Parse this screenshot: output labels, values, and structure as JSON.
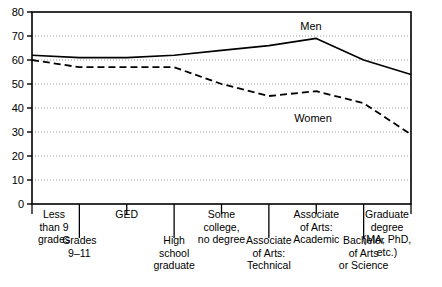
{
  "chart_data": {
    "type": "line",
    "title": "",
    "subtitle": "",
    "xlabel": "",
    "ylabel": "",
    "ylim": [
      0,
      80
    ],
    "yticks": [
      0,
      10,
      20,
      30,
      40,
      50,
      60,
      70,
      80
    ],
    "grid": true,
    "legend_position": "inline-annotation",
    "categories": [
      "Less than 9 grades",
      "Grades 9–11",
      "GED",
      "High school graduate",
      "Some college, no degree",
      "Associate of Arts: Technical",
      "Associate of Arts: Academic",
      "Bachelor of Arts or Science",
      "Graduate degree (MA, PhD, etc.)"
    ],
    "series": [
      {
        "name": "Men",
        "style": "solid",
        "values": [
          62,
          61,
          61,
          62,
          64,
          66,
          69,
          60,
          54
        ]
      },
      {
        "name": "Women",
        "style": "dashed",
        "values": [
          60,
          57,
          57,
          57,
          50,
          45,
          47,
          42,
          29
        ]
      }
    ]
  },
  "yaxis": {
    "ticks": [
      {
        "value": 80,
        "label": "80"
      },
      {
        "value": 70,
        "label": "70"
      },
      {
        "value": 60,
        "label": "60"
      },
      {
        "value": 50,
        "label": "50"
      },
      {
        "value": 40,
        "label": "40"
      },
      {
        "value": 30,
        "label": "30"
      },
      {
        "value": 20,
        "label": "20"
      },
      {
        "value": 10,
        "label": "10"
      },
      {
        "value": 0,
        "label": "0"
      }
    ]
  },
  "xaxis": {
    "categories": [
      {
        "index": 0,
        "row": "upper",
        "lines": [
          "Less",
          "than 9",
          "grades"
        ]
      },
      {
        "index": 1,
        "row": "lower",
        "lines": [
          "Grades",
          "9–11"
        ]
      },
      {
        "index": 2,
        "row": "upper",
        "lines": [
          "GED"
        ]
      },
      {
        "index": 3,
        "row": "lower",
        "lines": [
          "High",
          "school",
          "graduate"
        ]
      },
      {
        "index": 4,
        "row": "upper",
        "lines": [
          "Some",
          "college,",
          "no degree"
        ]
      },
      {
        "index": 5,
        "row": "lower",
        "lines": [
          "Associate",
          "of Arts:",
          "Technical"
        ]
      },
      {
        "index": 6,
        "row": "upper",
        "lines": [
          "Associate",
          "of Arts:",
          "Academic"
        ]
      },
      {
        "index": 7,
        "row": "lower",
        "lines": [
          "Bachelor",
          "of Arts",
          "or Science"
        ]
      },
      {
        "index": 8,
        "row": "upper",
        "lines": [
          "Graduate",
          "degree",
          "(MA, PhD,",
          "etc.)"
        ]
      }
    ]
  },
  "annotations": [
    {
      "name": "men-label",
      "text": "Men",
      "x_px": 311,
      "y_px": 30
    },
    {
      "name": "women-label",
      "text": "Women",
      "x_px": 313,
      "y_px": 122
    }
  ],
  "colors": {
    "line": "#000000",
    "grid": "#999999",
    "axis": "#000000",
    "background": "#ffffff"
  }
}
